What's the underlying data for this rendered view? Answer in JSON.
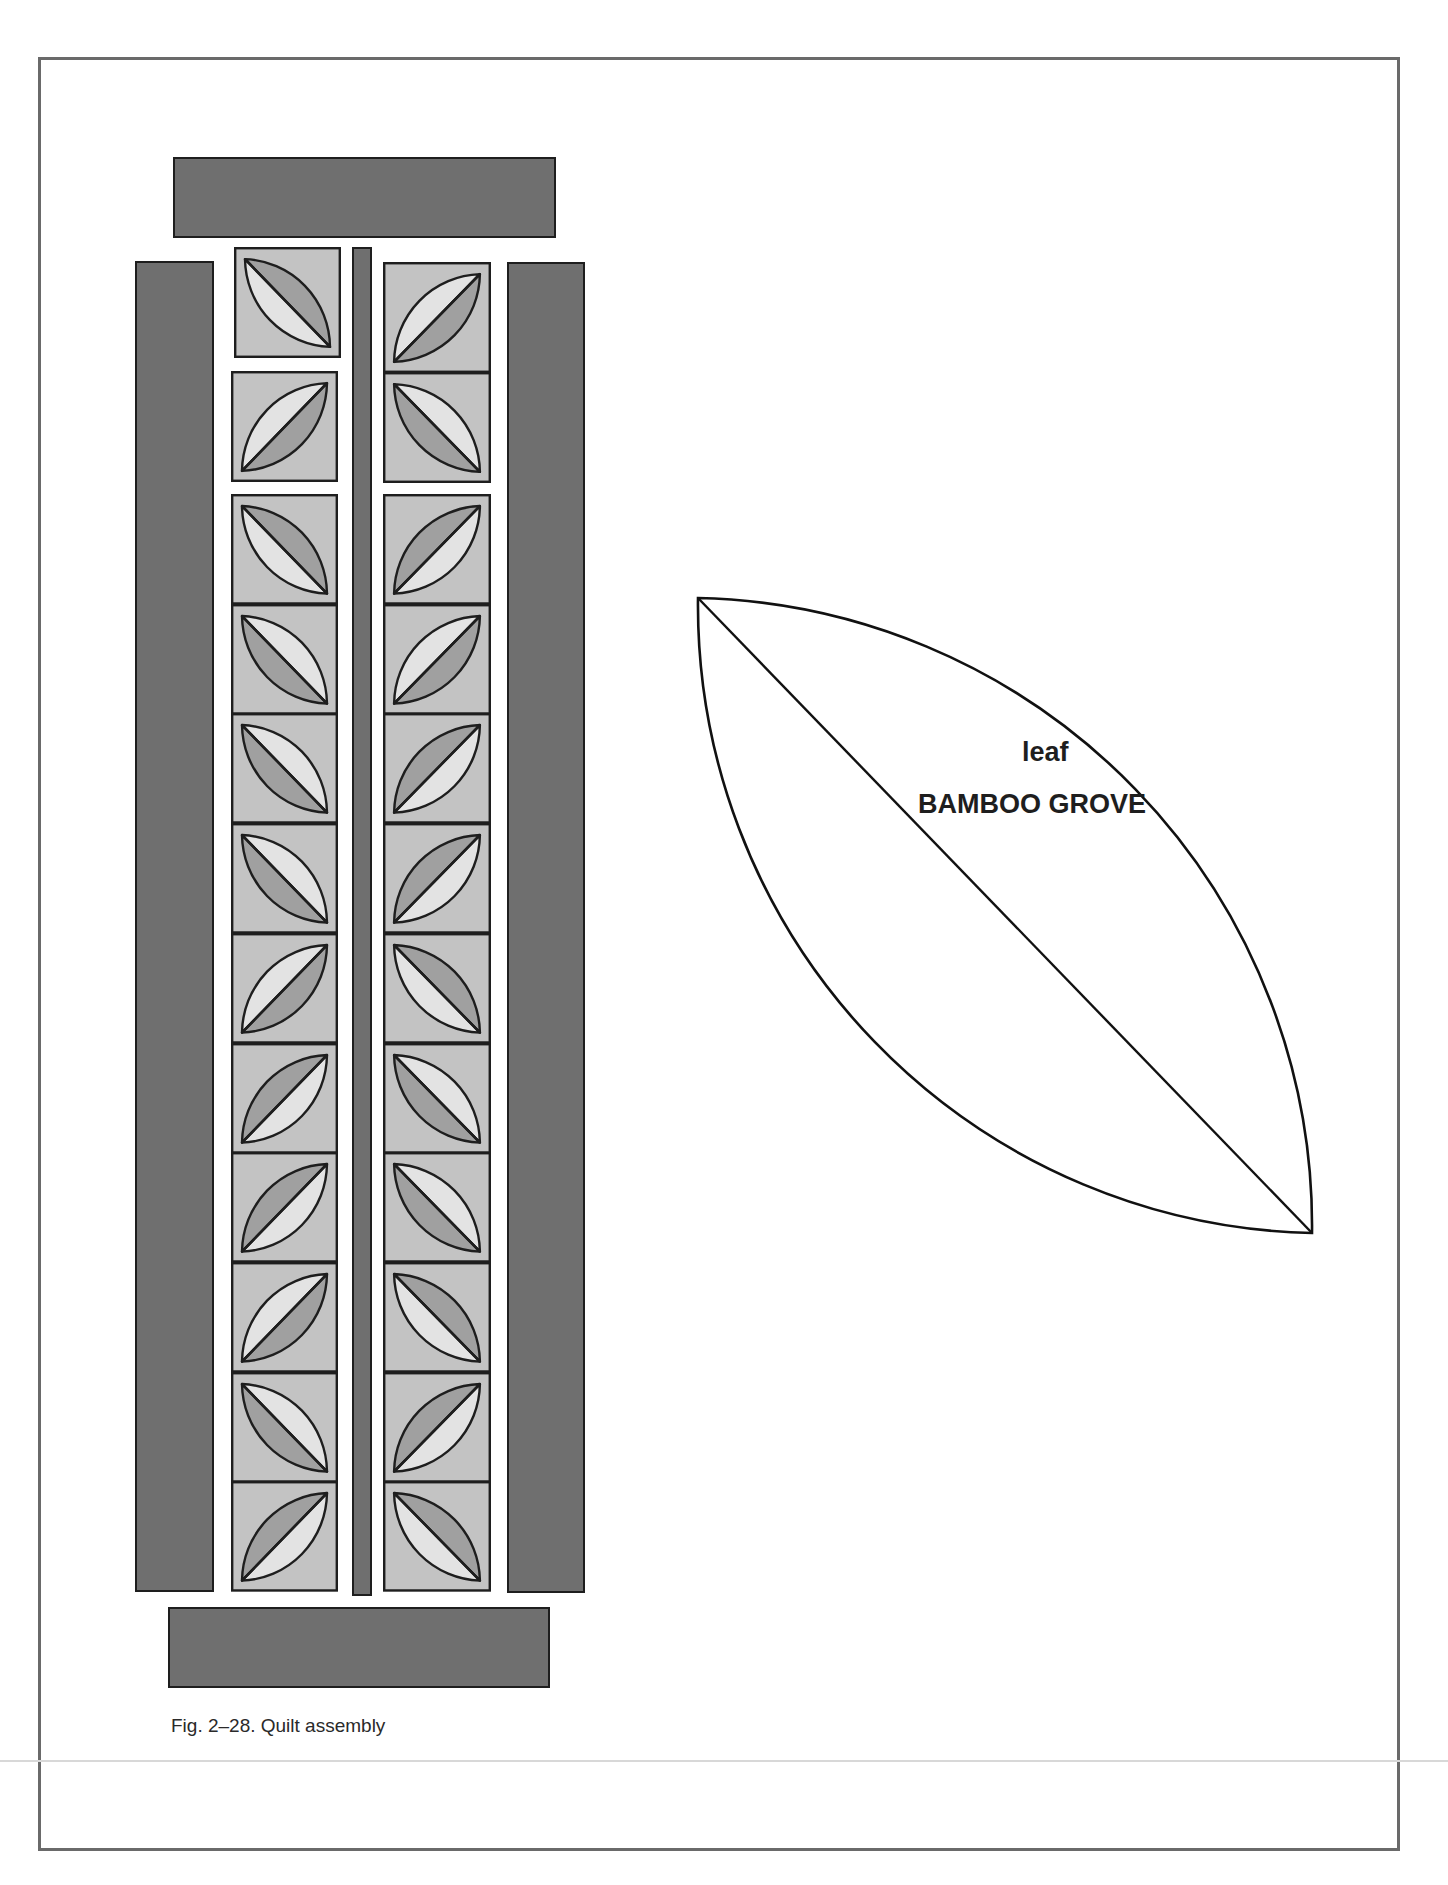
{
  "caption": "Fig. 2–28. Quilt assembly",
  "pattern_piece": {
    "name": "leaf",
    "pattern": "BAMBOO GROVE"
  },
  "colors": {
    "border_fabric": "#6f6f6f",
    "block_background": "#c3c3c3",
    "leaf_dark": "#a0a0a0",
    "leaf_light": "#e3e3e3",
    "outline": "#1e1e1e",
    "page_frame": "#6a6a6a"
  },
  "quilt": {
    "left_column": [
      {
        "dir": "\\",
        "dark": "tr"
      },
      {
        "dir": "/",
        "dark": "br"
      },
      {
        "dir": "\\",
        "dark": "tr"
      },
      {
        "dir": "\\",
        "dark": "bl"
      },
      {
        "dir": "\\",
        "dark": "bl"
      },
      {
        "dir": "\\",
        "dark": "bl"
      },
      {
        "dir": "/",
        "dark": "br"
      },
      {
        "dir": "/",
        "dark": "tl"
      },
      {
        "dir": "/",
        "dark": "tl"
      },
      {
        "dir": "/",
        "dark": "br"
      },
      {
        "dir": "\\",
        "dark": "bl"
      },
      {
        "dir": "/",
        "dark": "tl"
      }
    ],
    "right_column": [
      {
        "dir": "/",
        "dark": "br"
      },
      {
        "dir": "\\",
        "dark": "bl"
      },
      {
        "dir": "/",
        "dark": "tl"
      },
      {
        "dir": "/",
        "dark": "br"
      },
      {
        "dir": "/",
        "dark": "tl"
      },
      {
        "dir": "/",
        "dark": "tl"
      },
      {
        "dir": "\\",
        "dark": "tr"
      },
      {
        "dir": "\\",
        "dark": "bl"
      },
      {
        "dir": "\\",
        "dark": "bl"
      },
      {
        "dir": "\\",
        "dark": "tr"
      },
      {
        "dir": "/",
        "dark": "tl"
      },
      {
        "dir": "\\",
        "dark": "tr"
      }
    ]
  }
}
